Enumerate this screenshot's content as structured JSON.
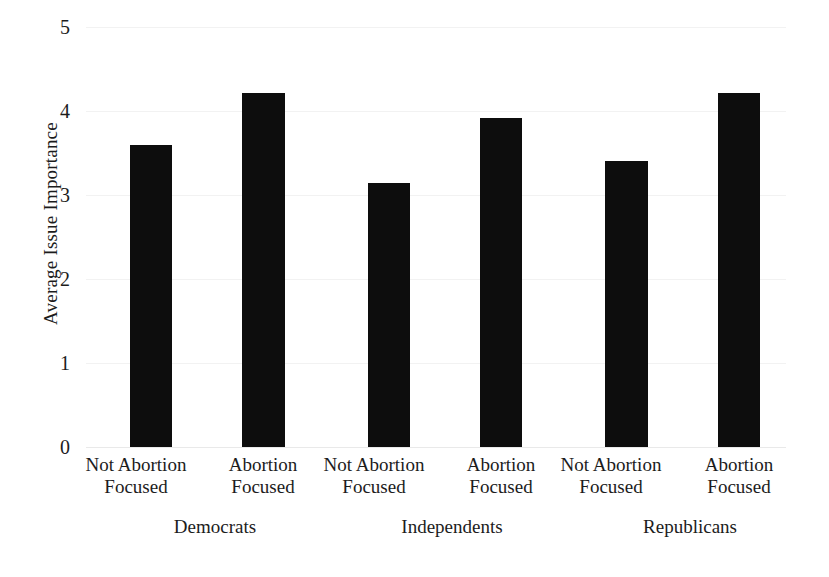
{
  "chart_data": {
    "type": "bar",
    "title": "",
    "xlabel": "",
    "ylabel": "Average Issue Importance",
    "ylim": [
      0,
      5
    ],
    "ytick_labels": [
      "5",
      "4",
      "3",
      "2",
      "1",
      "0"
    ],
    "yticks": [
      5,
      4,
      3,
      2,
      1,
      0
    ],
    "grid": true,
    "grid_axis": "y",
    "legend": "none",
    "bar_color": "#0d0d0d",
    "categories": [
      "Not Abortion Focused",
      "Abortion Focused",
      "Not Abortion Focused",
      "Abortion Focused",
      "Not Abortion Focused",
      "Abortion Focused"
    ],
    "values": [
      3.6,
      4.22,
      3.14,
      3.92,
      3.4,
      4.22
    ],
    "groups": [
      {
        "label": "Democrats",
        "categories": [
          "Not Abortion Focused",
          "Abortion Focused"
        ],
        "values": [
          3.6,
          4.22
        ]
      },
      {
        "label": "Independents",
        "categories": [
          "Not Abortion Focused",
          "Abortion Focused"
        ],
        "values": [
          3.14,
          3.92
        ]
      },
      {
        "label": "Republicans",
        "categories": [
          "Not Abortion Focused",
          "Abortion Focused"
        ],
        "values": [
          3.4,
          4.22
        ]
      }
    ]
  },
  "axis": {
    "y_title": "Average Issue Importance",
    "y_tick_5": "5",
    "y_tick_4": "4",
    "y_tick_3": "3",
    "y_tick_2": "2",
    "y_tick_1": "1",
    "y_tick_0": "0"
  },
  "x_labels": [
    {
      "line1": "Not Abortion",
      "line2": "Focused"
    },
    {
      "line1": "Abortion",
      "line2": "Focused"
    },
    {
      "line1": "Not Abortion",
      "line2": "Focused"
    },
    {
      "line1": "Abortion",
      "line2": "Focused"
    },
    {
      "line1": "Not Abortion",
      "line2": "Focused"
    },
    {
      "line1": "Abortion",
      "line2": "Focused"
    }
  ],
  "groups": [
    {
      "label": "Democrats"
    },
    {
      "label": "Independents"
    },
    {
      "label": "Republicans"
    }
  ]
}
